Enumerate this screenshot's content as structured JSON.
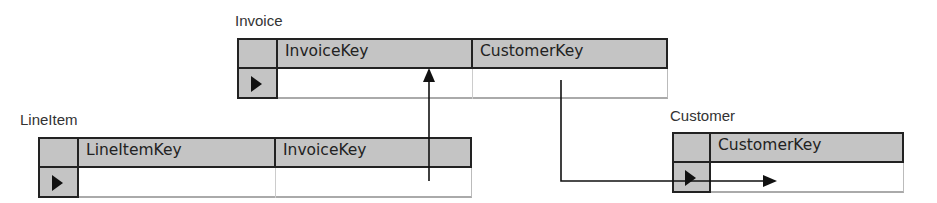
{
  "tables": {
    "invoice": {
      "name": "Invoice",
      "columns": [
        "InvoiceKey",
        "CustomerKey"
      ]
    },
    "lineitem": {
      "name": "LineItem",
      "columns": [
        "LineItemKey",
        "InvoiceKey"
      ]
    },
    "customer": {
      "name": "Customer",
      "columns": [
        "CustomerKey"
      ]
    }
  },
  "relationships": [
    {
      "from": "LineItem.InvoiceKey",
      "to": "Invoice.InvoiceKey"
    },
    {
      "from": "Invoice.CustomerKey",
      "to": "Customer.CustomerKey"
    }
  ],
  "colors": {
    "header": "#c4c4c4",
    "border": "#222222",
    "line": "#111111"
  }
}
